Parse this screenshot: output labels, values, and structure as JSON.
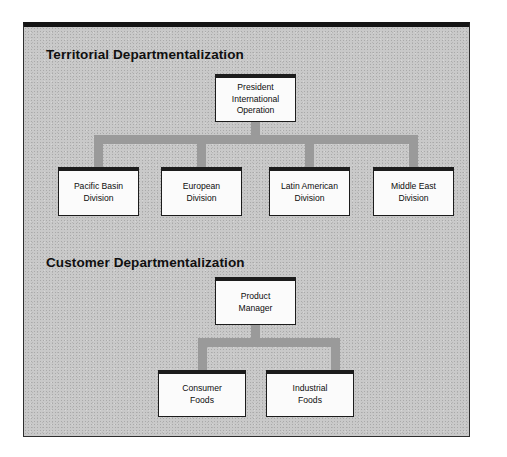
{
  "figure": {
    "background_color": "#c9c9c9",
    "frame_border_color": "#2e2e2e",
    "connector_color": "#9a9a9a",
    "node_fill_color": "#fbfbfb",
    "node_border_color": "#1c1c1c"
  },
  "sections": [
    {
      "heading": "Territorial Departmentalization",
      "root": {
        "label": "President\nInternational\nOperation"
      },
      "children": [
        {
          "label": "Pacific Basin\nDivision"
        },
        {
          "label": "European\nDivision"
        },
        {
          "label": "Latin American\nDivision"
        },
        {
          "label": "Middle East\nDivision"
        }
      ]
    },
    {
      "heading": "Customer Departmentalization",
      "root": {
        "label": "Product\nManager"
      },
      "children": [
        {
          "label": "Consumer\nFoods"
        },
        {
          "label": "Industrial\nFoods"
        }
      ]
    }
  ]
}
